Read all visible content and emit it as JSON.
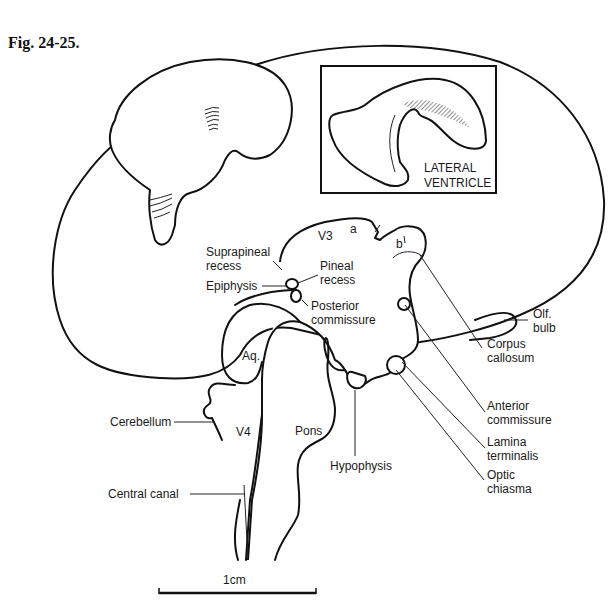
{
  "figure": {
    "title": "Fig. 24-25.",
    "inset_label_line1": "LATERAL",
    "inset_label_line2": "VENTRICLE",
    "scale_bar_label": "1cm"
  },
  "labels": {
    "v3": "V3",
    "a": "a",
    "b": "b",
    "suprapineal_1": "Suprapineal",
    "suprapineal_2": "recess",
    "pineal_1": "Pineal",
    "pineal_2": "recess",
    "epiphysis": "Epiphysis",
    "posterior_1": "Posterior",
    "posterior_2": "commissure",
    "olf_1": "Olf.",
    "olf_2": "bulb",
    "corpus_1": "Corpus",
    "corpus_2": "callosum",
    "aq": "Aq.",
    "cerebellum": "Cerebellum",
    "v4": "V4",
    "pons": "Pons",
    "anterior_1": "Anterior",
    "anterior_2": "commissure",
    "lamina_1": "Lamina",
    "lamina_2": "terminalis",
    "hypophysis": "Hypophysis",
    "optic_1": "Optic",
    "optic_2": "chiasma",
    "central_canal": "Central canal"
  },
  "colors": {
    "ink": "#111111",
    "stipple": "#bdbdbd",
    "background": "#ffffff"
  }
}
